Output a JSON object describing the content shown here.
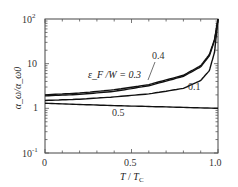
{
  "chart_data": {
    "type": "line",
    "title": "",
    "xlabel": "T / T_C",
    "ylabel": "α_ω / α_ω0",
    "xlim": [
      0,
      1.0
    ],
    "ylim": [
      0.1,
      100
    ],
    "yscale": "log",
    "x_ticks": [
      "0",
      "0.5",
      "1.0"
    ],
    "y_ticks": [
      "10^-1",
      "1",
      "10",
      "10^2"
    ],
    "grid": false,
    "legend": "inline annotations",
    "annotation_prefix": "ε_F / W = ",
    "series": [
      {
        "name": "0.3",
        "x": [
          0,
          0.2,
          0.4,
          0.6,
          0.8,
          0.9,
          0.95,
          0.98,
          1.0
        ],
        "values": [
          2.0,
          2.2,
          2.6,
          3.4,
          5.5,
          9,
          16,
          35,
          100
        ]
      },
      {
        "name": "0.4",
        "x": [
          0,
          0.2,
          0.4,
          0.6,
          0.8,
          0.9,
          0.95,
          0.98,
          1.0
        ],
        "values": [
          1.9,
          2.05,
          2.4,
          3.2,
          5.2,
          8.5,
          15,
          33,
          100
        ]
      },
      {
        "name": "0.1",
        "x": [
          0,
          0.2,
          0.4,
          0.6,
          0.8,
          0.9,
          0.95,
          0.98,
          1.0
        ],
        "values": [
          1.5,
          1.6,
          1.8,
          2.1,
          2.8,
          4.2,
          7,
          18,
          100
        ]
      },
      {
        "name": "0.5",
        "x": [
          0,
          0.2,
          0.4,
          0.6,
          0.8,
          1.0
        ],
        "values": [
          1.3,
          1.22,
          1.15,
          1.1,
          1.05,
          1.0
        ]
      }
    ],
    "annotations": [
      "ε_F / W = 0.3",
      "0.4",
      "0.1",
      "0.5"
    ]
  },
  "labels": {
    "y10_2": "10",
    "y10_2_exp": "2",
    "y10": "10",
    "y1": "1",
    "y10_m1": "10",
    "y10_m1_exp": "-1",
    "x0": "0",
    "x05": "0.5",
    "x10": "1.0",
    "xlabel_T": "T",
    "xlabel_sep": " / ",
    "xlabel_Tc": "T",
    "xlabel_Tc_sub": "C",
    "ylabel": "α_ω/α_ω0",
    "ann_03": "ε_F /W = 0.3",
    "ann_04": "0.4",
    "ann_01": "0.1",
    "ann_05": "0.5"
  }
}
